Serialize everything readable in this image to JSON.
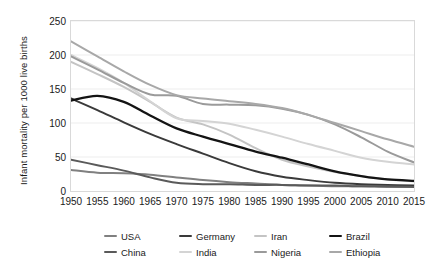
{
  "chart_data": {
    "type": "line",
    "title": "",
    "xlabel": "",
    "ylabel": "Infant mortality per 1000 live births",
    "xlim": [
      1950,
      2015
    ],
    "ylim": [
      0,
      250
    ],
    "ytick_values": [
      0,
      50,
      100,
      150,
      200,
      250
    ],
    "ytick_labels": [
      "0",
      "50",
      "100",
      "150",
      "200",
      "250"
    ],
    "x": [
      1950,
      1955,
      1960,
      1965,
      1970,
      1975,
      1980,
      1985,
      1990,
      1995,
      2000,
      2005,
      2010,
      2015
    ],
    "xtick_labels": [
      "1950",
      "1955",
      "1960",
      "1965",
      "1970",
      "1975",
      "1980",
      "1985",
      "1990",
      "1995",
      "2000",
      "2005",
      "2010",
      "2015"
    ],
    "grid": "horizontal",
    "legend_position": "bottom",
    "series": [
      {
        "name": "USA",
        "color": "#808080",
        "width": 2.0,
        "values": [
          31,
          27,
          26,
          24,
          20,
          16,
          13,
          11,
          9,
          8,
          7,
          7,
          6,
          6
        ]
      },
      {
        "name": "Germany",
        "color": "#3a3a3a",
        "width": 2.0,
        "values": [
          136,
          119,
          101,
          84,
          69,
          55,
          41,
          29,
          21,
          16,
          12,
          10,
          9,
          8
        ]
      },
      {
        "name": "Iran",
        "color": "#c4c4c4",
        "width": 2.0,
        "values": [
          190,
          172,
          153,
          131,
          108,
          98,
          83,
          63,
          46,
          36,
          28,
          22,
          17,
          14
        ]
      },
      {
        "name": "Brazil",
        "color": "#141414",
        "width": 2.3,
        "values": [
          133,
          140,
          131,
          111,
          92,
          80,
          69,
          58,
          49,
          39,
          29,
          22,
          17,
          15
        ]
      },
      {
        "name": "China",
        "color": "#5a5a5a",
        "width": 2.0,
        "values": [
          46,
          38,
          30,
          20,
          12,
          10,
          10,
          9,
          9,
          8,
          8,
          7,
          7,
          6
        ]
      },
      {
        "name": "India",
        "color": "#d4d4d4",
        "width": 2.0,
        "values": [
          200,
          181,
          159,
          132,
          107,
          103,
          99,
          90,
          80,
          69,
          59,
          49,
          43,
          39
        ]
      },
      {
        "name": "Nigeria",
        "color": "#9a9a9a",
        "width": 2.0,
        "values": [
          198,
          179,
          159,
          142,
          140,
          128,
          127,
          126,
          121,
          112,
          98,
          79,
          58,
          42
        ]
      },
      {
        "name": "Ethiopia",
        "color": "#a8a8a8",
        "width": 2.0,
        "values": [
          220,
          198,
          176,
          156,
          141,
          136,
          132,
          128,
          122,
          112,
          100,
          88,
          76,
          65
        ]
      }
    ]
  },
  "legend": {
    "items": [
      {
        "label": "USA"
      },
      {
        "label": "Germany"
      },
      {
        "label": "Iran"
      },
      {
        "label": "Brazil"
      },
      {
        "label": "China"
      },
      {
        "label": "India"
      },
      {
        "label": "Nigeria"
      },
      {
        "label": "Ethiopia"
      }
    ]
  }
}
